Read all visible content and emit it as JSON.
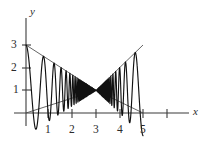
{
  "figure": {
    "background_color": "#ffffff",
    "curve_color": "#111111",
    "axis_color": "#3b3b3b",
    "envelope_color": "#4a4a4a"
  },
  "axes": {
    "x_axis_label": "x",
    "y_axis_label": "y",
    "x_ticks": [
      {
        "value": 1,
        "label": "1"
      },
      {
        "value": 2,
        "label": "2"
      },
      {
        "value": 3,
        "label": "3"
      },
      {
        "value": 4,
        "label": "4"
      },
      {
        "value": 5,
        "label": "5"
      },
      {
        "value": 6,
        "label": ""
      }
    ],
    "y_ticks": [
      {
        "value": 1,
        "label": "1"
      },
      {
        "value": 2,
        "label": "2"
      },
      {
        "value": 3,
        "label": "3"
      }
    ]
  },
  "chart_data": {
    "type": "line",
    "title": "",
    "subtitle": "",
    "xlabel": "x",
    "ylabel": "y",
    "xlim": [
      0,
      6.6
    ],
    "ylim": [
      0,
      3.4
    ],
    "xticks": [
      1,
      2,
      3,
      4,
      5,
      6
    ],
    "xticklabels": [
      "1",
      "2",
      "3",
      "4",
      "5",
      ""
    ],
    "yticks": [
      1,
      2,
      3
    ],
    "yticklabels": [
      "1",
      "2",
      "3"
    ],
    "grid": false,
    "legend": false,
    "legend_position": "none",
    "annotations": [
      {
        "text": "pinch point where oscillation amplitude is zero",
        "x": 3,
        "y": 1
      }
    ],
    "series": [
      {
        "name": "oscillating curve",
        "role": "main-curve",
        "formula": "y = 1 + 2*(3-x)/3 * cos(pi*k/(3-x))  (mirrored for x > 3)",
        "center_value": 1,
        "pinch_x": 3,
        "x_start": 0,
        "x_end": 5,
        "amplitude_at_x_start": 2,
        "amplitude_at_x_end": 2,
        "left_lobe_count": 6,
        "right_lobe_count": 5
      },
      {
        "name": "upper envelope",
        "role": "envelope",
        "points": [
          [
            0,
            3
          ],
          [
            3,
            1
          ],
          [
            5,
            3
          ]
        ]
      },
      {
        "name": "lower envelope",
        "role": "envelope",
        "points": [
          [
            0,
            -1
          ],
          [
            3,
            1
          ],
          [
            5,
            -1
          ]
        ],
        "visible_points": [
          [
            0,
            0
          ],
          [
            3,
            1
          ],
          [
            5,
            0
          ]
        ]
      }
    ]
  }
}
